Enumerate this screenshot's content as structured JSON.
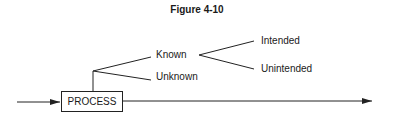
{
  "figure": {
    "title": "Figure 4-10",
    "process_label": "PROCESS",
    "branches": {
      "known": "Known",
      "unknown": "Unknown",
      "intended": "Intended",
      "unintended": "Unintended"
    }
  }
}
